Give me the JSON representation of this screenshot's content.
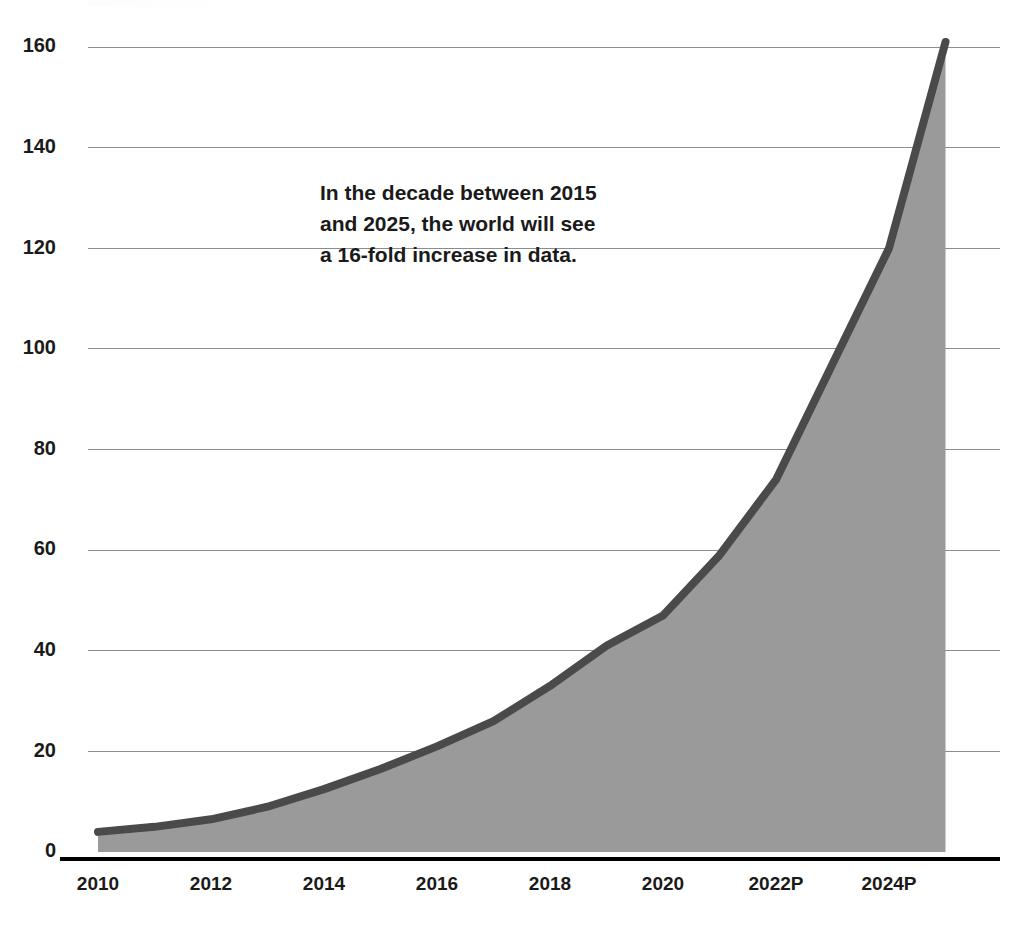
{
  "chart_data": {
    "type": "area",
    "title": "",
    "subtitle": "",
    "xlabel": "",
    "ylabel": "",
    "ylim": [
      0,
      168
    ],
    "xlim": [
      2010,
      2025
    ],
    "grid": true,
    "legend": false,
    "legend_position": "none",
    "annotation": {
      "lines": [
        "In the decade between 2015",
        "and 2025, the world will see",
        "a 16-fold increase in data."
      ],
      "x": 320,
      "y": 200
    },
    "series": [
      {
        "name": "Global data volume",
        "x": [
          2010,
          2011,
          2012,
          2013,
          2014,
          2015,
          2016,
          2017,
          2018,
          2019,
          2020,
          2021,
          2022,
          2023,
          2024,
          2025
        ],
        "values": [
          4,
          5,
          6.5,
          9,
          12.5,
          16.5,
          21,
          26,
          33,
          41,
          47,
          59,
          74,
          97,
          120,
          161
        ],
        "fill_color": "#9a9a9a",
        "line_color": "#4a4a4a"
      }
    ],
    "y_ticks": [
      0,
      20,
      40,
      60,
      80,
      100,
      120,
      140,
      160
    ],
    "y_tick_labels": [
      "0",
      "20",
      "40",
      "60",
      "80",
      "100",
      "120",
      "140",
      "160"
    ],
    "x_ticks": [
      2010,
      2012,
      2014,
      2016,
      2018,
      2020,
      2022,
      2024
    ],
    "x_tick_labels": [
      "2010",
      "2012",
      "2014",
      "2016",
      "2018",
      "2020",
      "2022P",
      "2024P"
    ]
  },
  "colors": {
    "area_fill": "#9a9a9a",
    "line_stroke": "#4a4a4a",
    "gridline": "#8c8c8c",
    "axis": "#000000",
    "text": "#1a1a1a",
    "background": "#ffffff"
  }
}
